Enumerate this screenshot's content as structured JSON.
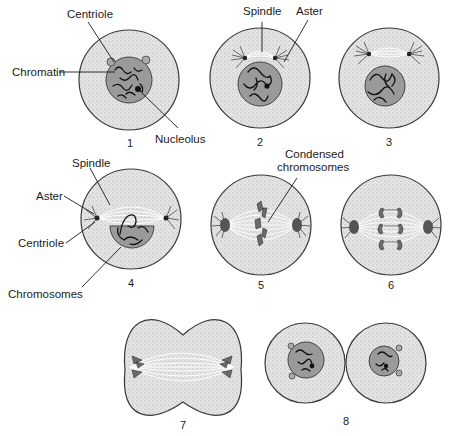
{
  "stages": [
    {
      "number": "1",
      "labels": [
        "Centriole",
        "Chromatin",
        "Nucleolus"
      ]
    },
    {
      "number": "2",
      "labels": [
        "Spindle",
        "Aster"
      ]
    },
    {
      "number": "3",
      "labels": []
    },
    {
      "number": "4",
      "labels": [
        "Spindle",
        "Aster",
        "Centriole",
        "Chromosomes"
      ]
    },
    {
      "number": "5",
      "labels": [
        "Condensed chromosomes"
      ]
    },
    {
      "number": "6",
      "labels": []
    },
    {
      "number": "7",
      "labels": []
    },
    {
      "number": "8",
      "labels": []
    }
  ],
  "labels": {
    "centriole_1": "Centriole",
    "chromatin_1": "Chromatin",
    "nucleolus_1": "Nucleolus",
    "spindle_2": "Spindle",
    "aster_2": "Aster",
    "spindle_4": "Spindle",
    "aster_4": "Aster",
    "centriole_4": "Centriole",
    "chromosomes_4": "Chromosomes",
    "condensed_line1": "Condensed",
    "condensed_line2": "chromosomes"
  },
  "numbers": [
    "1",
    "2",
    "3",
    "4",
    "5",
    "6",
    "7",
    "8"
  ],
  "colors": {
    "cytoplasm": "#e2e2e2",
    "nucleus": "#9a9a9a",
    "outline": "#3a3a3a",
    "chromatin": "#111111"
  }
}
